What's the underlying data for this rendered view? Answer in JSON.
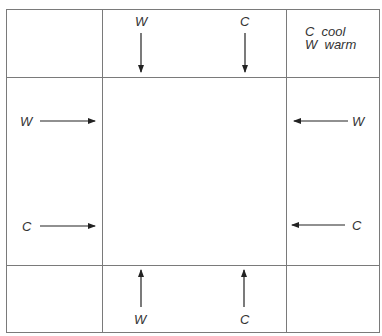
{
  "diagram": {
    "legend": [
      {
        "key": "C",
        "meaning": "cool",
        "text": "C  cool"
      },
      {
        "key": "W",
        "meaning": "warm",
        "text": "W  warm"
      }
    ],
    "arrows": {
      "top_left": {
        "label": "W",
        "direction": "down"
      },
      "top_right": {
        "label": "C",
        "direction": "down"
      },
      "left_upper": {
        "label": "W",
        "direction": "right"
      },
      "left_lower": {
        "label": "C",
        "direction": "right"
      },
      "right_upper": {
        "label": "W",
        "direction": "left"
      },
      "right_lower": {
        "label": "C",
        "direction": "left"
      },
      "bottom_left": {
        "label": "W",
        "direction": "up"
      },
      "bottom_right": {
        "label": "C",
        "direction": "up"
      }
    },
    "colors": {
      "lines": "#7a7a7a",
      "arrows": "#222222",
      "text": "#333333"
    }
  }
}
